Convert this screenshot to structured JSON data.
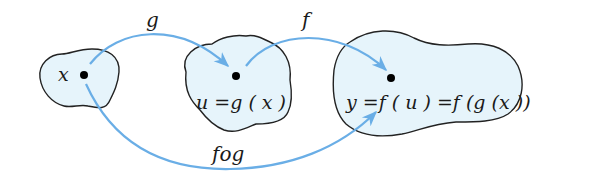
{
  "diagram": {
    "type": "function-composition",
    "colors": {
      "arrow": "#6aaee6",
      "blob_fill": "#e6f4fb",
      "blob_stroke": "#222222",
      "dot": "#000000",
      "text": "#1a1a1a"
    },
    "sets": [
      {
        "id": "domain-x",
        "point_label": "x"
      },
      {
        "id": "set-u",
        "point_label": "u =g ( x )"
      },
      {
        "id": "set-y",
        "point_label": "y =f ( u ) =f (g (x ))"
      }
    ],
    "arrows": [
      {
        "id": "g",
        "label": "g",
        "from": "x",
        "to": "u"
      },
      {
        "id": "f",
        "label": "f",
        "from": "u",
        "to": "y"
      },
      {
        "id": "fog",
        "label": "fog",
        "from": "x",
        "to": "y"
      }
    ]
  }
}
